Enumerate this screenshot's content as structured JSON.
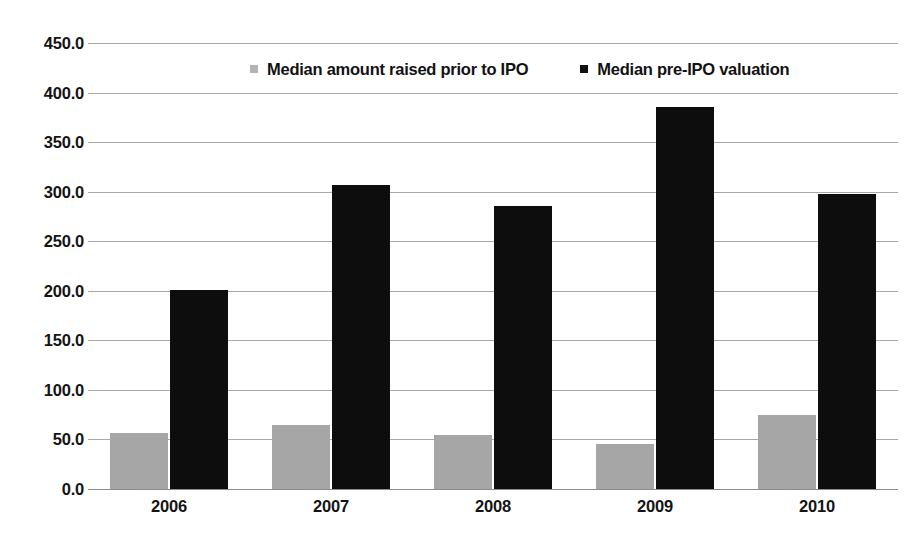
{
  "chart_data": {
    "type": "bar",
    "title": "",
    "xlabel": "",
    "ylabel": "",
    "categories": [
      "2006",
      "2007",
      "2008",
      "2009",
      "2010"
    ],
    "series": [
      {
        "name": "Median amount raised prior to IPO",
        "color": "#a6a6a6",
        "values": [
          57,
          65,
          55,
          45,
          75
        ]
      },
      {
        "name": "Median pre-IPO valuation",
        "color": "#0d0d0d",
        "values": [
          201,
          307,
          286,
          385,
          298
        ]
      }
    ],
    "ylim": [
      0,
      450
    ],
    "ytick_step": 50,
    "ytick_labels": [
      "0.0",
      "50.0",
      "100.0",
      "150.0",
      "200.0",
      "250.0",
      "300.0",
      "350.0",
      "400.0",
      "450.0"
    ],
    "grid": true,
    "legend_position": "top-center"
  },
  "legend": {
    "entries": [
      {
        "label": "Median amount raised prior to IPO",
        "swatch": "legend-swatch-gray"
      },
      {
        "label": "Median pre-IPO valuation",
        "swatch": "legend-swatch-black"
      }
    ]
  }
}
